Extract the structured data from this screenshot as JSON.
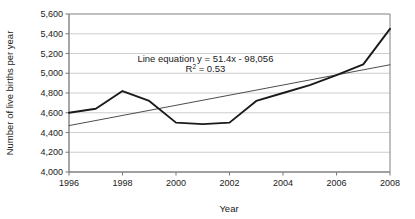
{
  "chart_data": {
    "type": "line",
    "title": "",
    "xlabel": "Year",
    "ylabel": "Number of live births per year",
    "xlim": [
      1996,
      2008
    ],
    "ylim": [
      4000,
      5600
    ],
    "ytick_step": 200,
    "xtick_step": 2,
    "grid": "horizontal",
    "legend": "none",
    "x": [
      1996,
      1997,
      1998,
      1999,
      2000,
      2001,
      2002,
      2003,
      2004,
      2005,
      2006,
      2007,
      2008
    ],
    "xtick_labels": [
      "1996",
      "1998",
      "2000",
      "2002",
      "2004",
      "2006",
      "2008"
    ],
    "xtick_values": [
      1996,
      1998,
      2000,
      2002,
      2004,
      2006,
      2008
    ],
    "ytick_labels": [
      "4,000",
      "4,200",
      "4,400",
      "4,600",
      "4,800",
      "5,000",
      "5,200",
      "5,400",
      "5,600"
    ],
    "ytick_values": [
      4000,
      4200,
      4400,
      4600,
      4800,
      5000,
      5200,
      5400,
      5600
    ],
    "series": [
      {
        "name": "Live births per year",
        "type": "line",
        "color": "#1a1a1a",
        "width": 1.9,
        "values": [
          4600,
          4640,
          4820,
          4720,
          4500,
          4485,
          4500,
          4720,
          4800,
          4880,
          4980,
          5090,
          5450
        ]
      },
      {
        "name": "Linear trend",
        "type": "trendline",
        "color": "#4d4d4d",
        "width": 1.0,
        "endpoints": [
          {
            "x": 1996,
            "y": 4470
          },
          {
            "x": 2008,
            "y": 5086
          }
        ]
      }
    ],
    "annotations": [
      {
        "name": "line-equation",
        "text": "Line equation y = 51.4x - 98,056",
        "x": 2001.1,
        "y": 5110
      },
      {
        "name": "r-squared-base",
        "text": "R",
        "sup": "2",
        "rest": " = 0.53",
        "x": 2001.1,
        "y": 5010
      }
    ],
    "fit": {
      "slope": 51.4,
      "intercept": -98056,
      "r_squared": 0.53,
      "equation_label": "Line equation y = 51.4x - 98,056",
      "r_squared_prefix": "R",
      "r_squared_exponent": "2",
      "r_squared_value": " = 0.53"
    },
    "colors": {
      "axis": "#808080",
      "grid": "#c8c8c8",
      "data_line": "#1a1a1a",
      "trend_line": "#555555",
      "text": "#1a1a1a",
      "background": "#ffffff"
    }
  }
}
